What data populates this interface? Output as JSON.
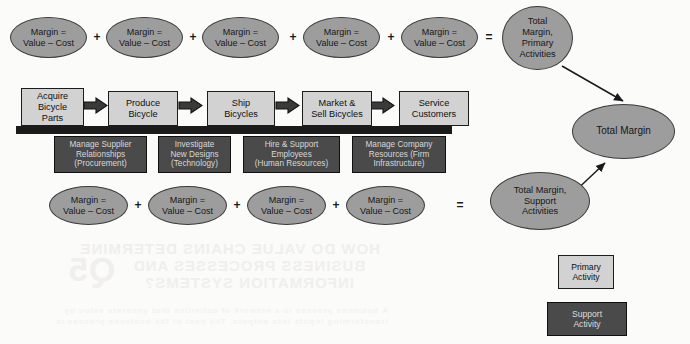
{
  "figure": {
    "type": "value-chain-diagram"
  },
  "colors": {
    "primary_fill": "#d2d2d2",
    "support_fill": "#4a4a4a",
    "ellipse_fill": "#9d9d9d",
    "outline": "#1c1c1c",
    "spine": "#1b1b1b",
    "page_background": "#fbfbfa"
  },
  "margin_formula": {
    "line1": "Margin =",
    "line2": "Value – Cost"
  },
  "operators": {
    "plus": "+",
    "equals": "="
  },
  "primary_row": {
    "margins": [
      {
        "line1": "Margin =",
        "line2": "Value – Cost"
      },
      {
        "line1": "Margin =",
        "line2": "Value – Cost"
      },
      {
        "line1": "Margin =",
        "line2": "Value – Cost"
      },
      {
        "line1": "Margin =",
        "line2": "Value – Cost"
      },
      {
        "line1": "Margin =",
        "line2": "Value – Cost"
      }
    ],
    "total": {
      "line1": "Total",
      "line2": "Margin,",
      "line3": "Primary",
      "line4": "Activities"
    },
    "activities": [
      {
        "line1": "Acquire",
        "line2": "Bicycle",
        "line3": "Parts"
      },
      {
        "line1": "Produce",
        "line2": "Bicycle",
        "line3": ""
      },
      {
        "line1": "Ship",
        "line2": "Bicycles",
        "line3": ""
      },
      {
        "line1": "Market &",
        "line2": "Sell Bicycles",
        "line3": ""
      },
      {
        "line1": "Service",
        "line2": "Customers",
        "line3": ""
      }
    ]
  },
  "support_row": {
    "activities": [
      {
        "line1": "Manage Supplier",
        "line2": "Relationships",
        "line3": "(Procurement)"
      },
      {
        "line1": "Investigate",
        "line2": "New Designs",
        "line3": "(Technology)"
      },
      {
        "line1": "Hire & Support",
        "line2": "Employees",
        "line3": "(Human Resources)"
      },
      {
        "line1": "Manage Company",
        "line2": "Resources (Firm",
        "line3": "Infrastructure)"
      }
    ],
    "margins": [
      {
        "line1": "Margin =",
        "line2": "Value – Cost"
      },
      {
        "line1": "Margin =",
        "line2": "Value – Cost"
      },
      {
        "line1": "Margin =",
        "line2": "Value – Cost"
      },
      {
        "line1": "Margin =",
        "line2": "Value – Cost"
      }
    ],
    "total": {
      "line1": "Total Margin,",
      "line2": "Support",
      "line3": "Activities"
    }
  },
  "grand_total": {
    "label": "Total Margin"
  },
  "legend": {
    "primary": {
      "line1": "Primary",
      "line2": "Activity"
    },
    "support": {
      "line1": "Support",
      "line2": "Activity"
    }
  },
  "bleed_through": {
    "heading_line1": "HOW DO VALUE CHAINS DETERMINE",
    "heading_line2": "BUSINESS PROCESSES AND",
    "heading_line3": "INFORMATION SYSTEMS?",
    "number": "Q5",
    "body_line1": "A business process is a network of activities that generate value by",
    "body_line2": "transforming inputs into outputs. The cost of the business process is"
  }
}
